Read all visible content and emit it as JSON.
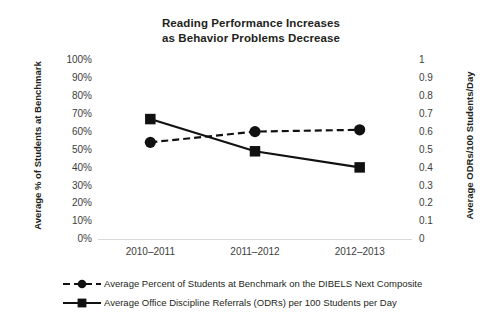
{
  "chart_data": {
    "type": "line",
    "title": "Reading Performance Increases as Behavior Problems Decrease",
    "title_lines": [
      "Reading Performance Increases",
      "as Behavior Problems Decrease"
    ],
    "categories": [
      "2010–2011",
      "2011–2012",
      "2012–2013"
    ],
    "xlabel": "",
    "ylabel": "Average % of Students at Benchmark",
    "y2label": "Average ODRs/100 Students/Day",
    "ylim": [
      0,
      100
    ],
    "y2lim": [
      0,
      1
    ],
    "y_ticks": [
      "100%",
      "90%",
      "80%",
      "70%",
      "60%",
      "50%",
      "40%",
      "30%",
      "20%",
      "10%",
      "0%"
    ],
    "y2_ticks": [
      "1",
      "0.9",
      "0.8",
      "0.7",
      "0.6",
      "0.5",
      "0.4",
      "0.3",
      "0.2",
      "0.1",
      "0"
    ],
    "grid": false,
    "legend_position": "bottom",
    "series": [
      {
        "name": "Average Percent of Students at Benchmark on the DIBELS Next Composite",
        "axis": "left",
        "values": [
          54,
          60,
          61
        ],
        "marker": "circle",
        "line_style": "dashed",
        "color": "#111111"
      },
      {
        "name": "Average Office Discipline Referrals (ODRs) per 100 Students per Day",
        "axis": "right",
        "values": [
          0.67,
          0.49,
          0.4
        ],
        "marker": "square",
        "line_style": "solid",
        "color": "#111111"
      }
    ]
  },
  "legend": {
    "items": [
      {
        "label": "Average Percent of Students at Benchmark on the DIBELS Next Composite",
        "marker": "circle",
        "line_style": "dashed"
      },
      {
        "label": "Average Office Discipline Referrals (ODRs) per 100 Students per Day",
        "marker": "square",
        "line_style": "solid"
      }
    ]
  },
  "colors": {
    "series": "#111111",
    "text": "#231f20",
    "tick_text": "#3d3d3d",
    "baseline": "#d9d9d9",
    "background": "#ffffff"
  }
}
